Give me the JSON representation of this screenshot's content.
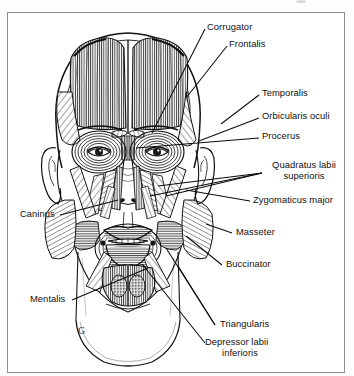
{
  "figure": {
    "style": "black and white pen-and-ink line engraving",
    "marks": {
      "g_marker": "G"
    }
  },
  "labels": {
    "corrugator": "Corrugator",
    "frontalis": "Frontalis",
    "temporalis": "Temporalis",
    "orbicularis_oculi": "Orbicularis oculi",
    "procerus": "Procerus",
    "quadratus_line1": "Quadratus labii",
    "quadratus_line2": "superioris",
    "zygomaticus_major": "Zygomaticus major",
    "masseter": "Masseter",
    "buccinator": "Buccinator",
    "triangularis": "Triangularis",
    "depressor_line1": "Depressor labii",
    "depressor_line2": "inferioris",
    "caninus": "Caninus",
    "mentalis": "Mentalis"
  },
  "colors": {
    "ink": "#101010",
    "paper": "#ffffff",
    "border": "#8d8d8d",
    "shade": "#3a3a3a"
  }
}
